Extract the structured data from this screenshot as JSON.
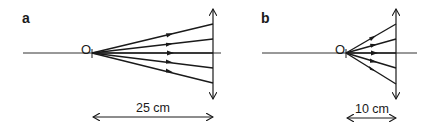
{
  "panels": [
    {
      "label": "a",
      "point_label": "O",
      "distance_label": "25 cm",
      "ray_count": 5
    },
    {
      "label": "b",
      "point_label": "O",
      "distance_label": "10 cm",
      "ray_count": 5
    }
  ],
  "colors": {
    "line": "#1a1a1a",
    "axis": "#333333",
    "background": "#ffffff"
  }
}
